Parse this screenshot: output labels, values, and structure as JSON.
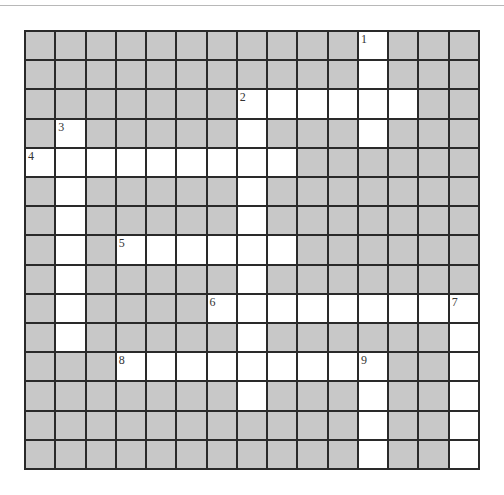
{
  "puzzle": {
    "rows": 15,
    "cols": 15,
    "colors": {
      "block": "#c8c8c8",
      "open": "#ffffff",
      "line": "#2a2a2a"
    },
    "open_cells": [
      [
        0,
        11
      ],
      [
        1,
        11
      ],
      [
        2,
        7
      ],
      [
        2,
        8
      ],
      [
        2,
        9
      ],
      [
        2,
        10
      ],
      [
        2,
        11
      ],
      [
        2,
        12
      ],
      [
        3,
        1
      ],
      [
        3,
        7
      ],
      [
        3,
        11
      ],
      [
        4,
        0
      ],
      [
        4,
        1
      ],
      [
        4,
        2
      ],
      [
        4,
        3
      ],
      [
        4,
        4
      ],
      [
        4,
        5
      ],
      [
        4,
        6
      ],
      [
        4,
        7
      ],
      [
        4,
        8
      ],
      [
        5,
        1
      ],
      [
        5,
        7
      ],
      [
        6,
        1
      ],
      [
        6,
        7
      ],
      [
        7,
        1
      ],
      [
        7,
        3
      ],
      [
        7,
        4
      ],
      [
        7,
        5
      ],
      [
        7,
        6
      ],
      [
        7,
        7
      ],
      [
        7,
        8
      ],
      [
        8,
        1
      ],
      [
        8,
        7
      ],
      [
        9,
        1
      ],
      [
        9,
        6
      ],
      [
        9,
        7
      ],
      [
        9,
        8
      ],
      [
        9,
        9
      ],
      [
        9,
        10
      ],
      [
        9,
        11
      ],
      [
        9,
        12
      ],
      [
        9,
        13
      ],
      [
        9,
        14
      ],
      [
        10,
        1
      ],
      [
        10,
        7
      ],
      [
        10,
        14
      ],
      [
        11,
        3
      ],
      [
        11,
        4
      ],
      [
        11,
        5
      ],
      [
        11,
        6
      ],
      [
        11,
        7
      ],
      [
        11,
        8
      ],
      [
        11,
        9
      ],
      [
        11,
        10
      ],
      [
        11,
        11
      ],
      [
        11,
        14
      ],
      [
        12,
        7
      ],
      [
        12,
        11
      ],
      [
        12,
        14
      ],
      [
        13,
        11
      ],
      [
        13,
        14
      ],
      [
        14,
        11
      ],
      [
        14,
        14
      ]
    ],
    "clue_numbers": [
      {
        "r": 0,
        "c": 11,
        "n": "1"
      },
      {
        "r": 2,
        "c": 7,
        "n": "2"
      },
      {
        "r": 3,
        "c": 1,
        "n": "3"
      },
      {
        "r": 4,
        "c": 0,
        "n": "4"
      },
      {
        "r": 7,
        "c": 3,
        "n": "5"
      },
      {
        "r": 9,
        "c": 6,
        "n": "6"
      },
      {
        "r": 9,
        "c": 14,
        "n": "7"
      },
      {
        "r": 11,
        "c": 3,
        "n": "8"
      },
      {
        "r": 11,
        "c": 11,
        "n": "9"
      }
    ]
  }
}
